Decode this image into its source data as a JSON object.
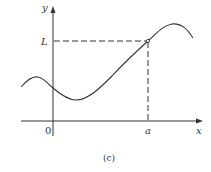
{
  "figure": {
    "caption": "(c)",
    "axes": {
      "x_label": "x",
      "y_label": "y",
      "origin_label": "0"
    },
    "marks": {
      "x_mark": "a",
      "y_mark": "L"
    },
    "colors": {
      "curve": "#333333",
      "axes": "#333333",
      "dashes": "#333333",
      "background": "#ffffff"
    }
  }
}
